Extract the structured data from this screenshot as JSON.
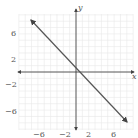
{
  "chart_data": {
    "type": "line",
    "title": "",
    "xlabel": "x",
    "ylabel": "y",
    "xlim": [
      -9,
      9
    ],
    "ylim": [
      -9,
      9
    ],
    "grid": true,
    "x_ticks": [
      -6,
      -2,
      2,
      6
    ],
    "y_ticks": [
      6,
      2,
      -2,
      -6
    ],
    "x_tick_labels": [
      "−6",
      "−2",
      "2",
      "6"
    ],
    "y_tick_labels": [
      "6",
      "2",
      "−2",
      "−6"
    ],
    "series": [
      {
        "name": "line",
        "equation": "y = -x + 1",
        "x": [
          -8,
          8
        ],
        "y": [
          9,
          -7
        ],
        "arrows_both_ends": true
      }
    ],
    "colors": {
      "line": "#555555",
      "grid": "#e6e6e6",
      "axis": "#333333"
    }
  },
  "labels": {
    "x_axis": "x",
    "y_axis": "y",
    "xt0": "−6",
    "xt1": "−2",
    "xt2": "2",
    "xt3": "6",
    "yt0": "6",
    "yt1": "2",
    "yt2": "−2",
    "yt3": "−6"
  }
}
